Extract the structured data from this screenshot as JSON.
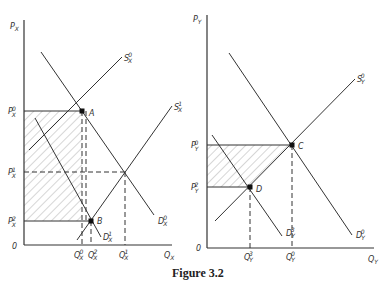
{
  "caption": "Figure 3.2",
  "left_panel": {
    "y_axis": {
      "base": "P",
      "sub": "X"
    },
    "x_axis": {
      "base": "Q",
      "sub": "X"
    },
    "origin": "0",
    "price_labels": [
      {
        "base": "P",
        "sub": "X",
        "sup": "0"
      },
      {
        "base": "P",
        "sub": "X",
        "sup": "1"
      },
      {
        "base": "P",
        "sub": "X",
        "sup": "2"
      }
    ],
    "quantity_labels": [
      {
        "base": "Q",
        "sub": "X",
        "sup": "0"
      },
      {
        "base": "Q",
        "sub": "X",
        "sup": "2"
      },
      {
        "base": "Q",
        "sub": "X",
        "sup": "1"
      }
    ],
    "curves": [
      {
        "base": "S",
        "sub": "X",
        "sup": "0"
      },
      {
        "base": "S",
        "sub": "X",
        "sup": "1"
      },
      {
        "base": "D",
        "sub": "X",
        "sup": "0"
      },
      {
        "base": "D",
        "sub": "X",
        "sup": "1"
      }
    ],
    "points": [
      "A",
      "B"
    ]
  },
  "right_panel": {
    "y_axis": {
      "base": "P",
      "sub": "Y"
    },
    "x_axis": {
      "base": "Q",
      "sub": "Y"
    },
    "origin": "0",
    "price_labels": [
      {
        "base": "P",
        "sub": "Y",
        "sup": "0"
      },
      {
        "base": "P",
        "sub": "Y",
        "sup": "2"
      }
    ],
    "quantity_labels": [
      {
        "base": "Q",
        "sub": "Y",
        "sup": "3"
      },
      {
        "base": "Q",
        "sub": "Y",
        "sup": "0"
      }
    ],
    "curves": [
      {
        "base": "S",
        "sub": "Y",
        "sup": "0"
      },
      {
        "base": "D",
        "sub": "Y",
        "sup": "0"
      },
      {
        "base": "D",
        "sub": "Y",
        "sup": "3"
      }
    ],
    "points": [
      "C",
      "D"
    ]
  }
}
